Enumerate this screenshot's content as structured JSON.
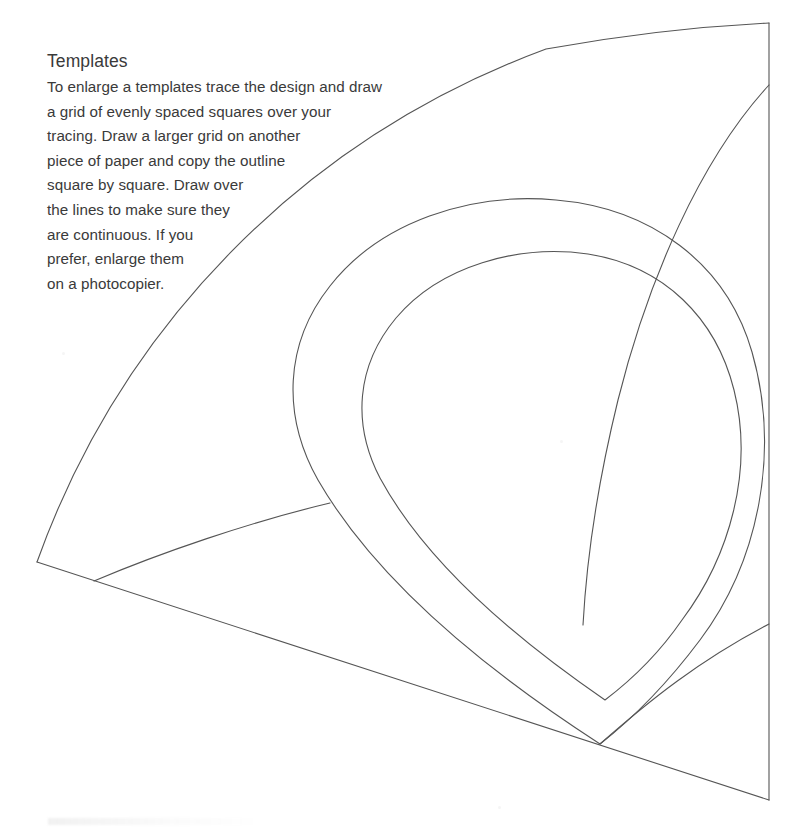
{
  "page": {
    "width": 804,
    "height": 835,
    "background_color": "#ffffff",
    "ink_color": "#555555",
    "text_color": "#3a3a3a"
  },
  "instructions": {
    "title": "Templates",
    "lines": [
      "To enlarge a templates trace the design and draw",
      "a grid of evenly spaced squares over your",
      "tracing. Draw a larger grid on another",
      "piece of paper and copy the outline",
      "square by square. Draw over",
      "the lines to make sure they",
      "are continuous. If you",
      "prefer, enlarge them",
      "on a photocopier."
    ],
    "full_text": "Templates To enlarge a templates trace the design and draw a grid of evenly spaced squares over your tracing. Draw a larger grid on another piece of paper and copy the outline square by square. Draw over the lines to make sure they are continuous. If you prefer, enlarge them on a photocopier."
  },
  "artwork": {
    "description": "Quilting / applique template: a quarter-fan segment containing a large teardrop (paisley) motif",
    "stroke_color": "#555555",
    "stroke_width": 1,
    "fill": "none",
    "shapes": [
      {
        "name": "fan-outer-arc",
        "kind": "arc",
        "path": "M 37 562 C 120 330 300 140 546 49 C 634 33 710 26 769 23"
      },
      {
        "name": "fan-left-radius",
        "kind": "line",
        "path": "M 37 562 L 769 800"
      },
      {
        "name": "fan-right-edge",
        "kind": "line",
        "path": "M 769 23 L 769 800"
      },
      {
        "name": "fan-inner-arc",
        "kind": "arc",
        "path": "M 94 581 C 160 553 250 522 330 503"
      },
      {
        "name": "band-arc-upper-right",
        "kind": "arc",
        "path": "M 769 85 C 700 160 648 280 618 400 C 596 490 586 570 583 625"
      },
      {
        "name": "teardrop-outer",
        "kind": "closed-curve",
        "path": "M 600 744 C 470 660 370 570 318 480 C 282 416 284 344 330 286 C 380 222 470 192 556 200 C 650 208 726 262 752 352 C 780 450 760 560 700 640 C 670 680 636 716 600 744 Z"
      },
      {
        "name": "teardrop-inner",
        "kind": "closed-curve",
        "path": "M 605 700 C 500 628 420 552 380 478 C 352 424 356 366 396 318 C 440 266 518 244 588 254 C 664 266 716 318 734 390 C 754 470 730 556 682 620 C 660 652 634 678 605 700 Z"
      },
      {
        "name": "corner-arc-lower-right",
        "kind": "arc",
        "path": "M 600 744 C 650 700 700 660 769 624"
      }
    ]
  }
}
